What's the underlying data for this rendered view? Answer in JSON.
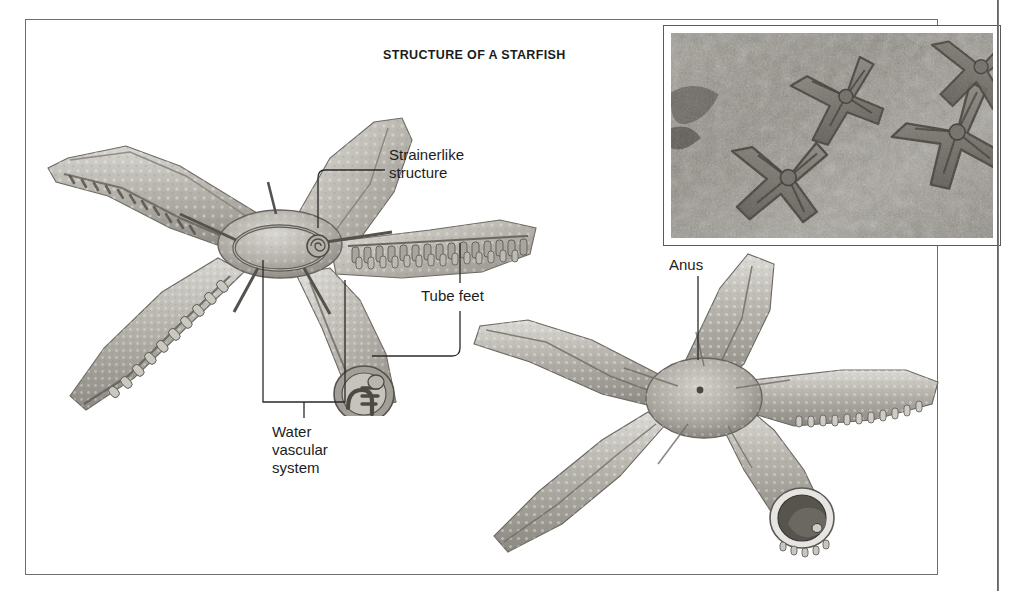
{
  "figure": {
    "title": "STRUCTURE OF A STARFISH",
    "frame_color": "#6f6f6f",
    "background": "#ffffff"
  },
  "labels": [
    {
      "id": "strainerlike",
      "text": "Strainerlike\nstructure",
      "name": "label-strainerlike-structure"
    },
    {
      "id": "tubefeet",
      "text": "Tube feet",
      "name": "label-tube-feet"
    },
    {
      "id": "watervas",
      "text": "Water\nvascular\nsystem",
      "name": "label-water-vascular-system"
    },
    {
      "id": "anus",
      "text": "Anus",
      "name": "label-anus"
    }
  ],
  "photo_inset": {
    "caption": "",
    "alt_name": "starfish-underwater-photograph",
    "frame_color": "#5a5a5a"
  },
  "illustrations": [
    {
      "id": "top",
      "alt_name": "starfish-oral-view-cutaway-illustration"
    },
    {
      "id": "bottom",
      "alt_name": "starfish-aboral-view-illustration"
    }
  ],
  "colors": {
    "ink": "#1d1d1d",
    "leader": "#2a2a2a",
    "frame": "#6f6f6f",
    "spine": "#4c4c4c"
  }
}
